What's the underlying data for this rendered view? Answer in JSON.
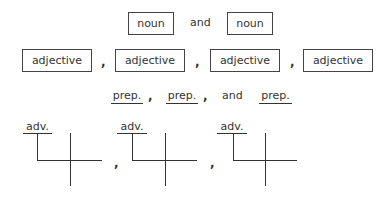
{
  "row_nouns": {
    "items": [
      {
        "label": "noun"
      },
      {
        "label": "noun"
      }
    ],
    "conjunction": "and"
  },
  "row_adjectives": {
    "items": [
      {
        "label": "adjective"
      },
      {
        "label": "adjective"
      },
      {
        "label": "adjective"
      },
      {
        "label": "adjective"
      }
    ],
    "separator": ","
  },
  "row_prepositions": {
    "items": [
      {
        "label": "prep."
      },
      {
        "label": "prep."
      },
      {
        "label": "prep."
      }
    ],
    "separator": ",",
    "conjunction": "and"
  },
  "row_adverb_diagrams": {
    "items": [
      {
        "label": "adv."
      },
      {
        "label": "adv."
      },
      {
        "label": "adv."
      }
    ],
    "separator": ","
  },
  "colors": {
    "line": "#333333",
    "text": "#333333",
    "background": "#ffffff"
  }
}
